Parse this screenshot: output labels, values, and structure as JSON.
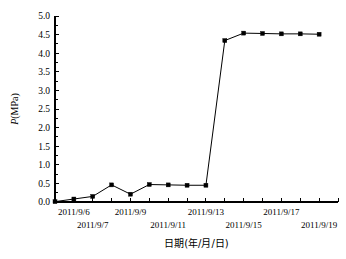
{
  "chart_data": {
    "type": "line",
    "title": "",
    "xlabel": "日期(年/月/日)",
    "ylabel": "P(MPa)",
    "ylim": [
      0.0,
      5.0
    ],
    "ytick_step": 0.5,
    "ytick_labels": [
      "0.0",
      "0.5",
      "1.0",
      "1.5",
      "2.0",
      "2.5",
      "3.0",
      "3.5",
      "4.0",
      "4.5",
      "5.0"
    ],
    "ytick_values": [
      0.0,
      0.5,
      1.0,
      1.5,
      2.0,
      2.5,
      3.0,
      3.5,
      4.0,
      4.5,
      5.0
    ],
    "grid": false,
    "legend": false,
    "legend_position": "none",
    "marker": "filled-square",
    "line_color": "#000000",
    "marker_color": "#000000",
    "xtick_labels_row1": [
      "2011/9/6",
      "2011/9/9",
      "2011/9/13",
      "2011/9/17"
    ],
    "xtick_labels_row2": [
      "2011/9/7",
      "2011/9/11",
      "2011/9/15",
      "2011/9/19"
    ],
    "xtick_label_row1_indices": [
      1,
      4,
      8,
      12
    ],
    "xtick_label_row2_indices": [
      2,
      6,
      10,
      14
    ],
    "xtick_count": 16,
    "x": [
      "2011/9/5",
      "2011/9/6",
      "2011/9/7",
      "2011/9/8",
      "2011/9/9",
      "2011/9/10",
      "2011/9/11",
      "2011/9/12",
      "2011/9/13",
      "2011/9/14",
      "2011/9/15",
      "2011/9/16",
      "2011/9/17",
      "2011/9/18",
      "2011/9/19"
    ],
    "values": [
      0.01,
      0.08,
      0.15,
      0.46,
      0.21,
      0.47,
      0.46,
      0.45,
      0.45,
      4.34,
      4.54,
      4.53,
      4.52,
      4.52,
      4.51
    ],
    "series": [
      {
        "name": "P",
        "values": [
          0.01,
          0.08,
          0.15,
          0.46,
          0.21,
          0.47,
          0.46,
          0.45,
          0.45,
          4.34,
          4.54,
          4.53,
          4.52,
          4.52,
          4.51
        ]
      }
    ],
    "annotations": []
  }
}
